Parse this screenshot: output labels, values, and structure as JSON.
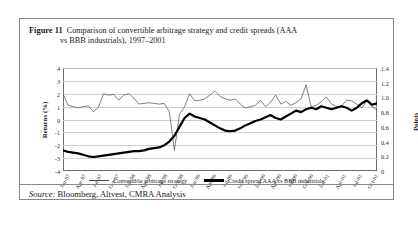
{
  "figure": {
    "label": "Figure 11",
    "caption_line1": "Comparison of convertible arbitrage strategy and credit spreads (AAA",
    "caption_line2": "vs BBB industrials), 1997–2001"
  },
  "source": {
    "prefix": "Source:",
    "text": "Bloomberg, Altvest, CMRA Analysis"
  },
  "chart_data": {
    "type": "line",
    "title": "Comparison of convertible arbitrage strategy and credit spreads (AAA vs BBB industrials), 1997–2001",
    "xlabel": "",
    "ylabel": "Returns (%)",
    "y2label": "Points",
    "ylim": [
      -4,
      4
    ],
    "y2lim": [
      0,
      1.4
    ],
    "grid": true,
    "legend_position": "bottom",
    "ytick_labels": [
      "4",
      "3",
      "2",
      "1",
      "0",
      "-1",
      "-2",
      "-3",
      "-4"
    ],
    "ytick_values": [
      4,
      3,
      2,
      1,
      0,
      -1,
      -2,
      -3,
      -4
    ],
    "y2tick_labels": [
      "1.4",
      "1.2",
      "1.0",
      "0.8",
      "0.6",
      "0.4",
      "0.2",
      "0"
    ],
    "y2tick_values": [
      1.4,
      1.2,
      1.0,
      0.8,
      0.6,
      0.4,
      0.2,
      0
    ],
    "xtick_labels": [
      "Jan-97",
      "Apr-97",
      "Jul-97",
      "Oct-97",
      "Jan-98",
      "Apr-98",
      "Jul-98",
      "Oct-98",
      "Jan-99",
      "Apr-99",
      "Jul-99",
      "Oct-99",
      "Jan-00",
      "Apr-00",
      "Jul-00",
      "Oct-00",
      "Jan-01",
      "Apr-01",
      "Jul-01",
      "Oct-01"
    ],
    "series": [
      {
        "name": "Convertible arbitrage strategy",
        "axis": "left",
        "unit": "%",
        "style": "thin",
        "color": "#4a4a4a",
        "values": [
          2.0,
          1.1,
          1.0,
          0.9,
          1.0,
          1.05,
          0.6,
          0.95,
          2.0,
          1.9,
          1.95,
          1.5,
          1.9,
          2.0,
          1.65,
          1.2,
          1.25,
          1.3,
          1.25,
          1.2,
          1.25,
          0.6,
          -2.4,
          0.4,
          1.0,
          2.0,
          1.45,
          1.5,
          1.6,
          1.9,
          2.2,
          1.8,
          1.6,
          1.5,
          1.6,
          1.2,
          0.9,
          1.0,
          1.1,
          1.5,
          1.0,
          1.35,
          1.9,
          1.2,
          1.4,
          1.1,
          1.3,
          1.6,
          2.7,
          1.0,
          1.1,
          1.4,
          1.75,
          1.2,
          1.0,
          1.05,
          1.5,
          1.45,
          1.2,
          0.9,
          1.5,
          1.0,
          0.75
        ]
      },
      {
        "name": "Credit spread AAA vs BBB industrials",
        "axis": "right",
        "unit": "points",
        "style": "thick",
        "color": "#000000",
        "values": [
          0.28,
          0.26,
          0.25,
          0.24,
          0.22,
          0.2,
          0.19,
          0.2,
          0.21,
          0.22,
          0.23,
          0.24,
          0.25,
          0.26,
          0.27,
          0.27,
          0.28,
          0.3,
          0.31,
          0.32,
          0.35,
          0.4,
          0.48,
          0.6,
          0.72,
          0.78,
          0.74,
          0.72,
          0.7,
          0.66,
          0.62,
          0.58,
          0.55,
          0.54,
          0.55,
          0.58,
          0.62,
          0.65,
          0.68,
          0.7,
          0.73,
          0.76,
          0.72,
          0.7,
          0.74,
          0.78,
          0.82,
          0.8,
          0.84,
          0.86,
          0.84,
          0.88,
          0.86,
          0.84,
          0.86,
          0.88,
          0.86,
          0.82,
          0.86,
          0.92,
          0.96,
          0.9,
          0.92
        ]
      }
    ]
  },
  "legend": {
    "items": [
      {
        "label": "Convertible arbitrage strategy",
        "style": "thin"
      },
      {
        "label": "Credit spread AAA vs BBB industrials",
        "style": "thick"
      }
    ]
  }
}
